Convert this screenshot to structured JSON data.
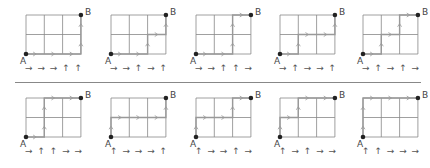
{
  "labels": {
    "start": "A",
    "end": "B"
  },
  "grid": {
    "cols": 3,
    "rows": 2
  },
  "colors": {
    "grid": "#888888",
    "path": "#999999",
    "point": "#222222"
  },
  "rows": [
    {
      "panels": [
        {
          "moves": [
            "R",
            "R",
            "R",
            "U",
            "U"
          ],
          "sequence": "→ → → ↑ ↑"
        },
        {
          "moves": [
            "R",
            "R",
            "U",
            "R",
            "U"
          ],
          "sequence": "→ → ↑ → ↑"
        },
        {
          "moves": [
            "R",
            "R",
            "U",
            "U",
            "R"
          ],
          "sequence": "→ → ↑ ↑ →"
        },
        {
          "moves": [
            "R",
            "U",
            "R",
            "R",
            "U"
          ],
          "sequence": "→ ↑ → → ↑"
        },
        {
          "moves": [
            "R",
            "U",
            "R",
            "U",
            "R"
          ],
          "sequence": "→ ↑ → ↑ →"
        }
      ]
    },
    {
      "panels": [
        {
          "moves": [
            "R",
            "U",
            "U",
            "R",
            "R"
          ],
          "sequence": "→ ↑ ↑ → →"
        },
        {
          "moves": [
            "U",
            "R",
            "R",
            "R",
            "U"
          ],
          "sequence": "↑ → → → ↑"
        },
        {
          "moves": [
            "U",
            "R",
            "R",
            "U",
            "R"
          ],
          "sequence": "↑ → → ↑ →"
        },
        {
          "moves": [
            "U",
            "R",
            "U",
            "R",
            "R"
          ],
          "sequence": "↑ → ↑ → →"
        },
        {
          "moves": [
            "U",
            "U",
            "R",
            "R",
            "R"
          ],
          "sequence": "↑ ↑ → → →"
        }
      ]
    }
  ]
}
